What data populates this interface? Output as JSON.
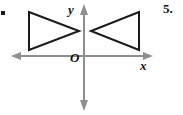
{
  "page": {
    "width": 183,
    "height": 115,
    "background_color": "#ffffff",
    "problem_number": "5.",
    "margin_mark": "."
  },
  "axes": {
    "color": "#8e8e8e",
    "y_label": "y",
    "x_label": "x",
    "origin_label": "O",
    "x_axis_y": 56,
    "y_axis_x": 84,
    "x_axis_start": 12,
    "x_axis_end": 152,
    "y_axis_start": 5,
    "y_axis_end": 110
  },
  "shapes": {
    "stroke_color": "#1a1a1a",
    "items": [
      {
        "name": "left-triangle",
        "orientation": "points-right",
        "points": "29,12 29,50 79,31"
      },
      {
        "name": "right-triangle",
        "orientation": "points-left",
        "points": "139,12 139,50 91,31"
      }
    ]
  },
  "chart_data": {
    "type": "scatter",
    "title": "",
    "xlabel": "x",
    "ylabel": "y",
    "grid": false,
    "legend": "none",
    "series": [
      {
        "name": "left-triangle",
        "vertices_px": [
          [
            29,
            12
          ],
          [
            29,
            50
          ],
          [
            79,
            31
          ]
        ]
      },
      {
        "name": "right-triangle",
        "vertices_px": [
          [
            139,
            12
          ],
          [
            139,
            50
          ],
          [
            91,
            31
          ]
        ]
      }
    ]
  }
}
